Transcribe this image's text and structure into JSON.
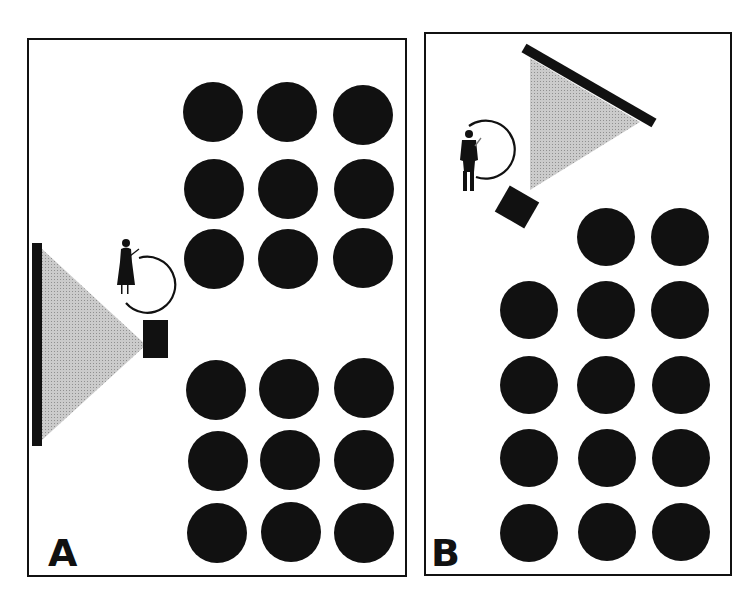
{
  "figure": {
    "colors": {
      "ink": "#111111",
      "light_cone": "#b9b9b9",
      "background": "#ffffff"
    }
  },
  "panels": [
    {
      "label": "A",
      "layout": "Screen on left wall, projector beside presenter, two blocks of 3x3 seating",
      "seat_rows_top": 3,
      "seat_rows_bottom": 3,
      "seats_per_row": 3,
      "total_seats": 18,
      "elements": [
        "screen",
        "projector",
        "light-cone",
        "presenter-female",
        "presenter-circle",
        "seats"
      ]
    },
    {
      "label": "B",
      "layout": "Screen angled in top corner, projector rotated, presenter at left, 14 seats",
      "seat_rows": [
        2,
        3,
        3,
        3,
        3
      ],
      "total_seats": 14,
      "elements": [
        "screen",
        "projector",
        "light-cone",
        "presenter-male",
        "presenter-circle",
        "seats"
      ]
    }
  ]
}
